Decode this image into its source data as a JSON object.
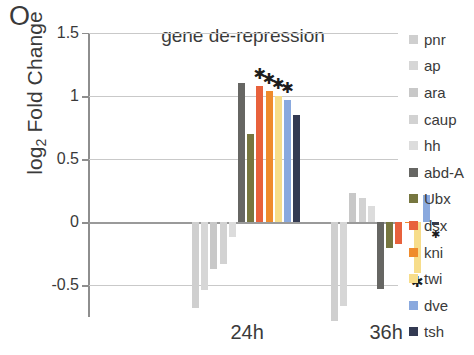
{
  "panel_label": "O",
  "axis": {
    "y_title_main": "Fold Change",
    "y_title_prefix": "log",
    "y_title_sub": "2",
    "y_ticks": [
      "1.5",
      "1",
      "0.5",
      "0",
      "-0.5"
    ],
    "x_ticks": [
      "24h",
      "36h"
    ]
  },
  "legend": {
    "items": [
      {
        "label": "pnr",
        "color": "#cfcfcf"
      },
      {
        "label": "ap",
        "color": "#d6d6d6"
      },
      {
        "label": "ara",
        "color": "#c8c8c8"
      },
      {
        "label": "caup",
        "color": "#d2d2d2"
      },
      {
        "label": "hh",
        "color": "#dcdcdc"
      },
      {
        "label": "abd-A",
        "color": "#666663"
      },
      {
        "label": "Ubx",
        "color": "#76763f"
      },
      {
        "label": "dsx",
        "color": "#e8613c"
      },
      {
        "label": "kni",
        "color": "#ef8b2c"
      },
      {
        "label": "twi",
        "color": "#f7dd8a"
      },
      {
        "label": "dve",
        "color": "#8aa9de"
      },
      {
        "label": "tsh",
        "color": "#333a52"
      }
    ]
  },
  "chart_data": {
    "type": "bar",
    "title": "gene de-repression",
    "xlabel": "",
    "ylabel": "log2 Fold Change",
    "ylim": [
      -0.75,
      1.5
    ],
    "yticks": [
      -0.5,
      0,
      0.5,
      1,
      1.5
    ],
    "grid": true,
    "legend_position": "right",
    "categories": [
      "24h",
      "36h"
    ],
    "series": [
      {
        "name": "pnr",
        "color": "#cfcfcf",
        "values": [
          -0.68,
          -0.78
        ],
        "stars": [
          0,
          0
        ]
      },
      {
        "name": "ap",
        "color": "#d6d6d6",
        "values": [
          -0.54,
          -0.66
        ],
        "stars": [
          0,
          0
        ]
      },
      {
        "name": "ara",
        "color": "#c8c8c8",
        "values": [
          -0.37,
          0.23
        ],
        "stars": [
          0,
          0
        ]
      },
      {
        "name": "caup",
        "color": "#d2d2d2",
        "values": [
          -0.33,
          0.19
        ],
        "stars": [
          0,
          0
        ]
      },
      {
        "name": "hh",
        "color": "#dcdcdc",
        "values": [
          -0.12,
          0.13
        ],
        "stars": [
          0,
          0
        ]
      },
      {
        "name": "abd-A",
        "color": "#666663",
        "values": [
          1.1,
          -0.53
        ],
        "stars": [
          0,
          0
        ]
      },
      {
        "name": "Ubx",
        "color": "#76763f",
        "values": [
          0.7,
          -0.2
        ],
        "stars": [
          0,
          0
        ]
      },
      {
        "name": "dsx",
        "color": "#e8613c",
        "values": [
          1.08,
          -0.17
        ],
        "stars": [
          1,
          0
        ]
      },
      {
        "name": "kni",
        "color": "#ef8b2c",
        "values": [
          1.04,
          0.0
        ],
        "stars": [
          1,
          0
        ]
      },
      {
        "name": "twi",
        "color": "#f7dd8a",
        "values": [
          1.0,
          -0.4
        ],
        "stars": [
          1,
          1
        ]
      },
      {
        "name": "dve",
        "color": "#8aa9de",
        "values": [
          0.97,
          0.22
        ],
        "stars": [
          1,
          0
        ]
      },
      {
        "name": "tsh",
        "color": "#333a52",
        "values": [
          0.85,
          -0.02
        ],
        "stars": [
          0,
          1
        ]
      }
    ]
  }
}
